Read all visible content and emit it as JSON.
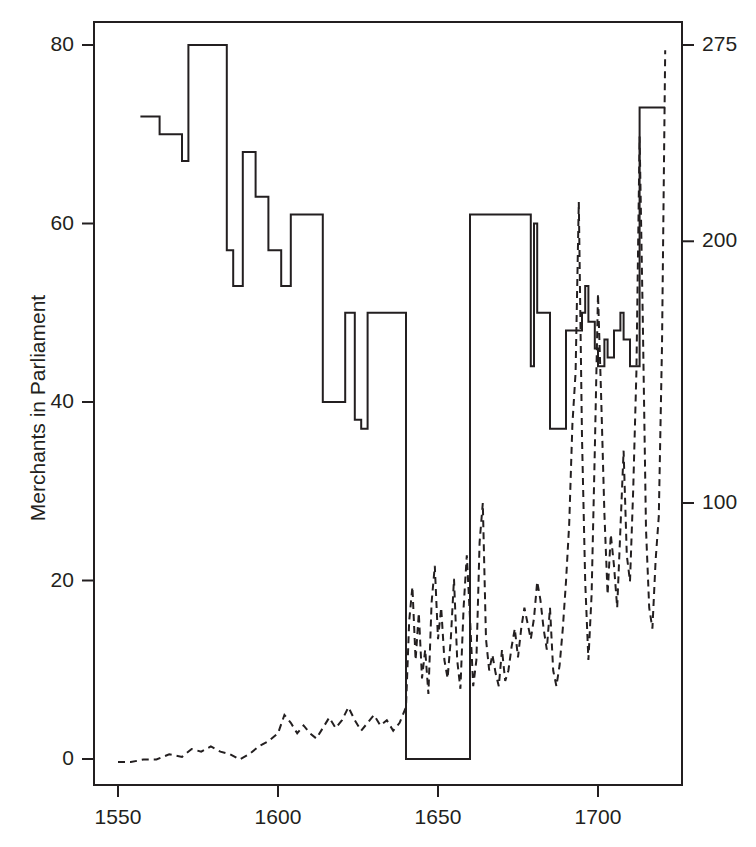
{
  "chart_data": {
    "type": "line",
    "title": "",
    "xlabel": "",
    "ylabel": "Merchants in Parliament",
    "y2label": "",
    "xlim": [
      1546,
      1722
    ],
    "ylim": [
      0,
      82
    ],
    "y2lim": [
      0,
      282
    ],
    "grid": false,
    "legend": "none",
    "x_ticks": [
      1550,
      1600,
      1650,
      1700
    ],
    "x_tick_labels": [
      "1550",
      "1600",
      "1650",
      "1700"
    ],
    "y_ticks": [
      0,
      20,
      40,
      60,
      80
    ],
    "y_tick_labels": [
      "0",
      "20",
      "40",
      "60",
      "80"
    ],
    "y2_ticks": [
      100,
      200,
      275
    ],
    "y2_tick_labels": [
      "100",
      "200",
      "275"
    ],
    "series": [
      {
        "name": "Merchants in Parliament",
        "style": "solid",
        "axis": "left",
        "color": "#231f20",
        "interpolation": "step-post",
        "points": [
          [
            1557,
            72
          ],
          [
            1563,
            72
          ],
          [
            1563,
            70
          ],
          [
            1570,
            70
          ],
          [
            1570,
            67
          ],
          [
            1572,
            67
          ],
          [
            1572,
            80
          ],
          [
            1584,
            80
          ],
          [
            1584,
            57
          ],
          [
            1586,
            57
          ],
          [
            1586,
            53
          ],
          [
            1589,
            53
          ],
          [
            1589,
            68
          ],
          [
            1593,
            68
          ],
          [
            1593,
            63
          ],
          [
            1597,
            63
          ],
          [
            1597,
            57
          ],
          [
            1601,
            57
          ],
          [
            1601,
            53
          ],
          [
            1604,
            53
          ],
          [
            1604,
            61
          ],
          [
            1614,
            61
          ],
          [
            1614,
            40
          ],
          [
            1621,
            40
          ],
          [
            1621,
            50
          ],
          [
            1624,
            50
          ],
          [
            1624,
            38
          ],
          [
            1626,
            38
          ],
          [
            1626,
            37
          ],
          [
            1628,
            37
          ],
          [
            1628,
            50
          ],
          [
            1640,
            50
          ],
          [
            1640,
            0
          ],
          [
            1660,
            0
          ],
          [
            1660,
            61
          ],
          [
            1679,
            61
          ],
          [
            1679,
            44
          ],
          [
            1680,
            44
          ],
          [
            1680,
            60
          ],
          [
            1681,
            60
          ],
          [
            1681,
            50
          ],
          [
            1685,
            50
          ],
          [
            1685,
            37
          ],
          [
            1690,
            37
          ],
          [
            1690,
            48
          ],
          [
            1695,
            48
          ],
          [
            1695,
            50
          ],
          [
            1696,
            50
          ],
          [
            1696,
            53
          ],
          [
            1697,
            53
          ],
          [
            1697,
            49
          ],
          [
            1699,
            49
          ],
          [
            1699,
            46
          ],
          [
            1700,
            46
          ],
          [
            1700,
            44
          ],
          [
            1702,
            44
          ],
          [
            1702,
            47
          ],
          [
            1703,
            47
          ],
          [
            1703,
            45
          ],
          [
            1705,
            45
          ],
          [
            1705,
            48
          ],
          [
            1707,
            48
          ],
          [
            1707,
            50
          ],
          [
            1708,
            50
          ],
          [
            1708,
            47
          ],
          [
            1710,
            47
          ],
          [
            1710,
            44
          ],
          [
            1713,
            44
          ],
          [
            1713,
            73
          ],
          [
            1721,
            73
          ]
        ]
      },
      {
        "name": "Trade value",
        "style": "dashed",
        "axis": "right",
        "color": "#231f20",
        "interpolation": "linear",
        "points": [
          [
            1550,
            1
          ],
          [
            1554,
            1
          ],
          [
            1558,
            2
          ],
          [
            1562,
            2
          ],
          [
            1566,
            4
          ],
          [
            1570,
            3
          ],
          [
            1573,
            6
          ],
          [
            1576,
            5
          ],
          [
            1579,
            7
          ],
          [
            1582,
            5
          ],
          [
            1585,
            4
          ],
          [
            1588,
            2
          ],
          [
            1591,
            4
          ],
          [
            1594,
            7
          ],
          [
            1597,
            9
          ],
          [
            1600,
            12
          ],
          [
            1602,
            19
          ],
          [
            1604,
            16
          ],
          [
            1606,
            12
          ],
          [
            1608,
            15
          ],
          [
            1610,
            12
          ],
          [
            1612,
            10
          ],
          [
            1614,
            14
          ],
          [
            1616,
            18
          ],
          [
            1618,
            14
          ],
          [
            1620,
            17
          ],
          [
            1622,
            22
          ],
          [
            1624,
            17
          ],
          [
            1626,
            13
          ],
          [
            1628,
            16
          ],
          [
            1630,
            19
          ],
          [
            1632,
            15
          ],
          [
            1634,
            17
          ],
          [
            1636,
            13
          ],
          [
            1638,
            16
          ],
          [
            1640,
            22
          ],
          [
            1641,
            55
          ],
          [
            1642,
            68
          ],
          [
            1643,
            40
          ],
          [
            1644,
            58
          ],
          [
            1645,
            33
          ],
          [
            1646,
            44
          ],
          [
            1647,
            27
          ],
          [
            1648,
            62
          ],
          [
            1649,
            76
          ],
          [
            1650,
            48
          ],
          [
            1651,
            60
          ],
          [
            1652,
            40
          ],
          [
            1653,
            33
          ],
          [
            1654,
            48
          ],
          [
            1655,
            71
          ],
          [
            1656,
            40
          ],
          [
            1657,
            29
          ],
          [
            1658,
            60
          ],
          [
            1659,
            80
          ],
          [
            1660,
            56
          ],
          [
            1661,
            30
          ],
          [
            1662,
            40
          ],
          [
            1663,
            85
          ],
          [
            1664,
            100
          ],
          [
            1665,
            48
          ],
          [
            1666,
            36
          ],
          [
            1667,
            42
          ],
          [
            1668,
            35
          ],
          [
            1669,
            30
          ],
          [
            1670,
            44
          ],
          [
            1671,
            32
          ],
          [
            1672,
            36
          ],
          [
            1673,
            45
          ],
          [
            1674,
            52
          ],
          [
            1675,
            41
          ],
          [
            1676,
            52
          ],
          [
            1677,
            60
          ],
          [
            1678,
            54
          ],
          [
            1679,
            48
          ],
          [
            1680,
            56
          ],
          [
            1681,
            70
          ],
          [
            1682,
            63
          ],
          [
            1683,
            52
          ],
          [
            1684,
            44
          ],
          [
            1685,
            60
          ],
          [
            1686,
            36
          ],
          [
            1687,
            30
          ],
          [
            1688,
            38
          ],
          [
            1689,
            52
          ],
          [
            1690,
            70
          ],
          [
            1691,
            92
          ],
          [
            1692,
            130
          ],
          [
            1693,
            150
          ],
          [
            1694,
            215
          ],
          [
            1695,
            125
          ],
          [
            1696,
            70
          ],
          [
            1697,
            40
          ],
          [
            1698,
            65
          ],
          [
            1699,
            120
          ],
          [
            1700,
            180
          ],
          [
            1701,
            140
          ],
          [
            1702,
            96
          ],
          [
            1703,
            65
          ],
          [
            1704,
            88
          ],
          [
            1705,
            76
          ],
          [
            1706,
            60
          ],
          [
            1707,
            90
          ],
          [
            1708,
            120
          ],
          [
            1709,
            80
          ],
          [
            1710,
            70
          ],
          [
            1711,
            105
          ],
          [
            1712,
            150
          ],
          [
            1713,
            240
          ],
          [
            1714,
            170
          ],
          [
            1715,
            90
          ],
          [
            1716,
            60
          ],
          [
            1717,
            52
          ],
          [
            1718,
            78
          ],
          [
            1719,
            95
          ],
          [
            1720,
            160
          ],
          [
            1721,
            273
          ]
        ]
      }
    ]
  },
  "axes": {
    "left_title": "Merchants in Parliament"
  }
}
